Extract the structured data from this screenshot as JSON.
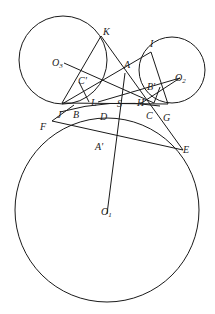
{
  "figure": {
    "type": "geometry-diagram"
  },
  "circles": [
    {
      "name": "O1",
      "cx": 107,
      "cy": 195,
      "r": 92
    },
    {
      "name": "O2",
      "cx": 172,
      "cy": 70,
      "r": 32
    },
    {
      "name": "O3",
      "cx": 63,
      "cy": 58,
      "r": 45
    }
  ],
  "points": {
    "K": {
      "x": 101,
      "y": 35,
      "label": "K"
    },
    "I": {
      "x": 150,
      "y": 44,
      "label": "I"
    },
    "A": {
      "x": 125,
      "y": 68,
      "label": "A"
    },
    "O3": {
      "x": 60,
      "y": 63,
      "label": "O",
      "sub": "3"
    },
    "O2": {
      "x": 183,
      "y": 78,
      "label": "O",
      "sub": "2"
    },
    "C'": {
      "x": 77,
      "y": 82,
      "label": "C'"
    },
    "B'": {
      "x": 160,
      "y": 87,
      "label": "B'"
    },
    "L": {
      "x": 91,
      "y": 103,
      "label": "L"
    },
    "S": {
      "x": 118,
      "y": 106,
      "label": "S"
    },
    "H": {
      "x": 139,
      "y": 105,
      "label": "H"
    },
    "J": {
      "x": 57,
      "y": 115,
      "label": "J"
    },
    "B": {
      "x": 73,
      "y": 115,
      "label": "B"
    },
    "D": {
      "x": 103,
      "y": 118,
      "label": "D"
    },
    "C": {
      "x": 148,
      "y": 116,
      "label": "C"
    },
    "G": {
      "x": 167,
      "y": 119,
      "label": "G"
    },
    "F": {
      "x": 41,
      "y": 129,
      "label": "F"
    },
    "E": {
      "x": 183,
      "y": 149,
      "label": "E"
    },
    "A'": {
      "x": 98,
      "y": 146,
      "label": "A'"
    },
    "O1": {
      "x": 107,
      "y": 214,
      "label": "O",
      "sub": "1"
    }
  }
}
